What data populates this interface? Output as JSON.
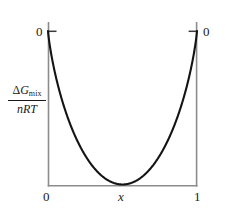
{
  "figure": {
    "kind": "line-plot",
    "background_color": "#ffffff",
    "axis_color": "#8c8c8c",
    "curve_color": "#141414",
    "text_color": "#1a1a1a",
    "axis_box": {
      "left": 48,
      "right": 197,
      "top": 31,
      "bottom": 186
    },
    "y_axis_label": {
      "numerator_delta": "Δ",
      "numerator_symbol": "G",
      "numerator_subscript": "mix",
      "denominator": "nRT"
    },
    "x_axis_label": "x",
    "tick_labels": {
      "y_top_left": "0",
      "y_top_right": "0",
      "x_left": "0",
      "x_right": "1"
    },
    "ticks": [
      {
        "name": "y-axis-top-tick",
        "side": "left",
        "value": "0"
      },
      {
        "name": "y-axis-top-tick-right",
        "side": "right",
        "value": "0"
      }
    ]
  },
  "chart_data": {
    "type": "line",
    "title": "",
    "xlabel": "x",
    "ylabel": "ΔG_mix / nRT",
    "xlim": [
      0,
      1
    ],
    "ylim": [
      -0.7,
      0
    ],
    "grid": false,
    "legend": null,
    "annotations": [
      {
        "text": "0",
        "at": [
          0,
          0
        ],
        "position": "left-of-axis-top"
      },
      {
        "text": "0",
        "at": [
          1,
          0
        ],
        "position": "right-of-axis-top"
      },
      {
        "text": "0",
        "at": [
          0,
          null
        ],
        "position": "below-axis-left"
      },
      {
        "text": "1",
        "at": [
          1,
          null
        ],
        "position": "below-axis-right"
      },
      {
        "text": "x",
        "at": [
          0.5,
          null
        ],
        "position": "below-axis-center"
      }
    ],
    "series": [
      {
        "name": "ΔG_mix/nRT = x ln x + (1-x) ln(1-x)",
        "x": [
          0,
          0.02,
          0.04,
          0.06,
          0.08,
          0.1,
          0.15,
          0.2,
          0.25,
          0.3,
          0.35,
          0.4,
          0.45,
          0.5,
          0.55,
          0.6,
          0.65,
          0.7,
          0.75,
          0.8,
          0.85,
          0.9,
          0.92,
          0.94,
          0.96,
          0.98,
          1
        ],
        "values": [
          0,
          -0.098,
          -0.169,
          -0.228,
          -0.279,
          -0.325,
          -0.423,
          -0.5,
          -0.562,
          -0.611,
          -0.647,
          -0.673,
          -0.688,
          -0.693,
          -0.688,
          -0.673,
          -0.647,
          -0.611,
          -0.562,
          -0.5,
          -0.423,
          -0.325,
          -0.279,
          -0.228,
          -0.169,
          -0.098,
          0
        ]
      }
    ],
    "minimum": {
      "x": 0.5,
      "y": -0.693
    }
  }
}
